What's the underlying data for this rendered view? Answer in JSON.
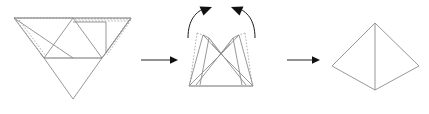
{
  "diagram": {
    "title": "Folding a square pyramid net into a solid",
    "background_color": "#ffffff",
    "stroke_color": "#8c8c8c",
    "hidden_stroke_color": "#a8a8a8",
    "arrow_color": "#111111",
    "stages": [
      {
        "id": "stage-net",
        "label": "flat net",
        "description": "Unfolded net: a central upward triangle with three surrounding triangles, shown flat with dotted hidden construction lines."
      },
      {
        "id": "stage-folding",
        "label": "partially folded",
        "description": "Side triangles lifted upward mid-fold, with two curved arrows indicating the folding motion."
      },
      {
        "id": "stage-solid",
        "label": "finished pyramid",
        "description": "Completed square pyramid viewed in three-quarter perspective with a vertical front edge."
      }
    ],
    "transitions": [
      {
        "id": "arrow-net-to-folding",
        "label": "becomes",
        "direction": "right"
      },
      {
        "id": "arrow-folding-to-solid",
        "label": "becomes",
        "direction": "right"
      }
    ],
    "fold_arrows": [
      {
        "id": "fold-arrow-left",
        "label": "fold up left flap",
        "direction": "up-right"
      },
      {
        "id": "fold-arrow-right",
        "label": "fold up right flap",
        "direction": "up-left"
      }
    ],
    "geometry": {
      "net": {
        "top_left": [
          14,
          18
        ],
        "top_mid": [
          73,
          18
        ],
        "top_right": [
          131,
          18
        ],
        "base_left": [
          44,
          58
        ],
        "base_right": [
          102,
          58
        ],
        "bottom_apex": [
          73,
          99
        ],
        "flap_left_inner": [
          40,
          53
        ],
        "flap_right_inner": [
          106,
          53
        ]
      },
      "folding": {
        "base_left": [
          189,
          86
        ],
        "base_right": [
          253,
          86
        ],
        "center_notch": [
          221,
          54
        ],
        "left_peak_outer": [
          197,
          33
        ],
        "left_peak_inner": [
          209,
          38
        ],
        "right_peak_outer": [
          245,
          33
        ],
        "right_peak_inner": [
          233,
          38
        ]
      },
      "solid": {
        "apex": [
          375,
          23
        ],
        "left": [
          332,
          66
        ],
        "right": [
          419,
          66
        ],
        "front": [
          375,
          90
        ]
      }
    }
  }
}
